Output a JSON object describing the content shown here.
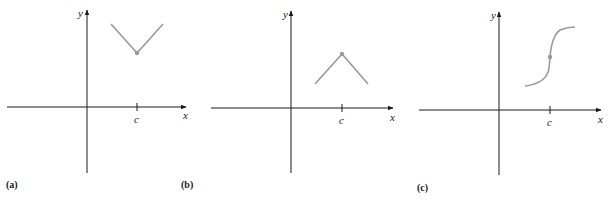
{
  "panels": [
    {
      "caption": "(a)",
      "x_label": "x",
      "y_label": "y",
      "tick_label": "c",
      "description": "V-shaped graph with minimum (corner) at x = c; filled point at vertex",
      "shape": "v-min"
    },
    {
      "caption": "(b)",
      "x_label": "x",
      "y_label": "y",
      "tick_label": "c",
      "description": "Inverted V graph with maximum (corner) at x = c; filled point at peak",
      "shape": "v-max"
    },
    {
      "caption": "(c)",
      "x_label": "x",
      "y_label": "y",
      "tick_label": "c",
      "description": "S-shaped increasing curve with vertical tangent at x = c; filled point at inflection",
      "shape": "vertical-tangent"
    }
  ],
  "colors": {
    "axis": "#1a1a1a",
    "curve": "#9a9a9a"
  }
}
